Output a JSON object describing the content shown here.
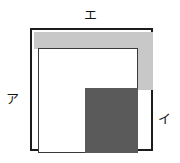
{
  "figure": {
    "canvas": {
      "width": 180,
      "height": 163,
      "background": "#ffffff"
    },
    "colors": {
      "outline": "#1c1c1c",
      "inner_outline": "#3a3a3a",
      "light_gray": "#c8c8c8",
      "dark_gray": "#5a5a5a",
      "white": "#ffffff",
      "label_text": "#151515"
    },
    "shapes": {
      "outer_square": {
        "name": "outer-square",
        "x": 30,
        "y": 28,
        "width": 123,
        "height": 123
      },
      "light_band_top": {
        "name": "light-gray-top-band",
        "x": 32,
        "y": 30,
        "width": 119,
        "height": 17
      },
      "light_band_right": {
        "name": "light-gray-right-band",
        "x": 136,
        "y": 30,
        "width": 15,
        "height": 58
      },
      "inner_rectangle": {
        "name": "inner-white-rectangle",
        "x": 36,
        "y": 46,
        "width": 100,
        "height": 105
      },
      "dark_square": {
        "name": "dark-gray-square",
        "x": 83,
        "y": 86,
        "width": 53,
        "height": 65
      }
    },
    "labels": {
      "top": "エ",
      "left": "ア",
      "right": "イ"
    }
  }
}
